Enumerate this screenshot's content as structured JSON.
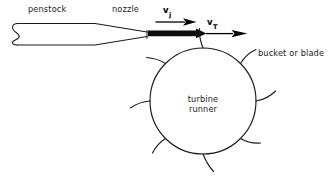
{
  "diagram": {
    "background_color": "#ffffff",
    "line_color": "#1a1a1a",
    "jet_color": "#0d0d0d",
    "labels": {
      "penstock": "penstock",
      "nozzle": "nozzle",
      "bucket_or_blade": "bucket or blade",
      "turbine_line1": "turbine",
      "turbine_line2": "runner"
    },
    "velocities": [
      {
        "name": "jet-velocity",
        "symbol": "v",
        "subscript": "j",
        "description": "velocity of the water jet leaving the nozzle",
        "arrow_direction": "right"
      },
      {
        "name": "bucket-tangential-velocity",
        "symbol": "v",
        "subscript": "T",
        "description": "tangential velocity of the turbine bucket",
        "arrow_direction": "right"
      }
    ],
    "components": [
      {
        "name": "penstock",
        "shape": "broken-ended pipe"
      },
      {
        "name": "nozzle",
        "shape": "converging taper"
      },
      {
        "name": "water-jet",
        "shape": "solid black arrow"
      },
      {
        "name": "turbine-runner",
        "shape": "circle"
      },
      {
        "name": "buckets",
        "shape": "curved arcs",
        "count": 8
      }
    ],
    "runner": {
      "center_x": 203,
      "center_y": 101,
      "radius": 53
    }
  }
}
